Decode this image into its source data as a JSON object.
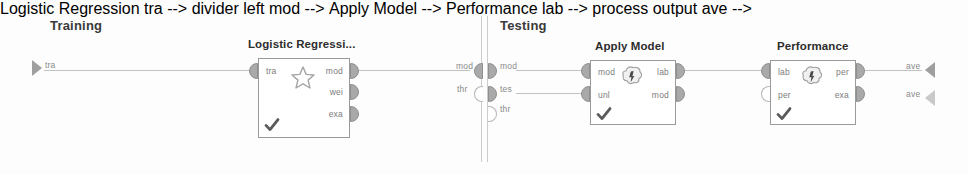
{
  "canvas": {
    "width": 968,
    "height": 174,
    "background": "#fdfdfd",
    "wire_color": "#c2c2c2",
    "box_border_color": "#9a9a9a",
    "port_fill_color": "#a9a9a9",
    "title_color": "#2d2d2d",
    "port_label_color": "#7c7c7c"
  },
  "sections": {
    "training": {
      "label": "Training"
    },
    "testing": {
      "label": "Testing"
    }
  },
  "process_inputs": {
    "training_source": {
      "label": "tra"
    }
  },
  "divider_ports": {
    "left": [
      {
        "label": "mod"
      },
      {
        "label": "thr"
      }
    ],
    "right": [
      {
        "label": "mod"
      },
      {
        "label": "tes"
      },
      {
        "label": "thr"
      }
    ]
  },
  "process_outputs": [
    {
      "label": "ave"
    },
    {
      "label": "ave"
    }
  ],
  "operators": [
    {
      "id": "logistic-regression",
      "title": "Logistic Regressi...",
      "icon": "star-icon",
      "status": "check-icon",
      "inputs": [
        {
          "label": "tra",
          "connected": true
        }
      ],
      "outputs": [
        {
          "label": "mod",
          "connected": true
        },
        {
          "label": "wei",
          "connected": true
        },
        {
          "label": "exa",
          "connected": true
        }
      ]
    },
    {
      "id": "apply-model",
      "title": "Apply Model",
      "icon": "blob-icon",
      "status": "check-icon",
      "inputs": [
        {
          "label": "mod",
          "connected": true
        },
        {
          "label": "unl",
          "connected": true
        }
      ],
      "outputs": [
        {
          "label": "lab",
          "connected": true
        },
        {
          "label": "mod",
          "connected": true
        }
      ]
    },
    {
      "id": "performance",
      "title": "Performance",
      "icon": "blob-icon",
      "status": "check-icon",
      "inputs": [
        {
          "label": "lab",
          "connected": true
        },
        {
          "label": "per",
          "connected": false
        }
      ],
      "outputs": [
        {
          "label": "per",
          "connected": true
        },
        {
          "label": "exa",
          "connected": true
        }
      ]
    }
  ]
}
